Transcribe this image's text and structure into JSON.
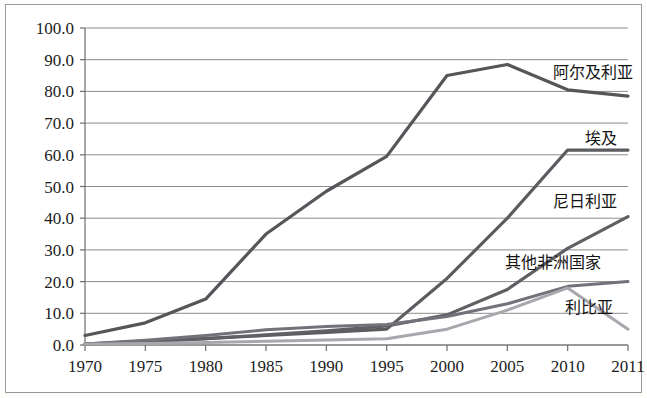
{
  "chart_data": {
    "type": "line",
    "title": "",
    "subtitle": "",
    "xlabel": "",
    "ylabel": "",
    "categories": [
      "1970",
      "1975",
      "1980",
      "1985",
      "1990",
      "1995",
      "2000",
      "2005",
      "2010",
      "2011"
    ],
    "ylim": [
      0,
      100
    ],
    "ytick_labels": [
      "0.0",
      "10.0",
      "20.0",
      "30.0",
      "40.0",
      "50.0",
      "60.0",
      "70.0",
      "80.0",
      "90.0",
      "100.0"
    ],
    "ytick_values": [
      0,
      10,
      20,
      30,
      40,
      50,
      60,
      70,
      80,
      90,
      100
    ],
    "grid": true,
    "grid_axis": "y",
    "legend": "inline-right-labels",
    "series": [
      {
        "name": "阿尔及利亚",
        "color": "#55555a",
        "width": 3.2,
        "label_x": 553,
        "label_y": 78,
        "values": [
          3.0,
          7.0,
          14.5,
          35.0,
          48.5,
          59.5,
          85.0,
          88.5,
          80.5,
          78.5
        ]
      },
      {
        "name": "埃及",
        "color": "#5b5b60",
        "width": 3.2,
        "label_x": 585,
        "label_y": 144,
        "values": [
          0.3,
          1.2,
          2.0,
          3.0,
          4.0,
          5.0,
          21.0,
          40.0,
          61.5,
          61.5
        ]
      },
      {
        "name": "尼日利亚",
        "color": "#5f5f64",
        "width": 3.2,
        "label_x": 553,
        "label_y": 207,
        "values": [
          0.2,
          1.0,
          2.0,
          3.2,
          4.5,
          6.0,
          9.5,
          17.5,
          30.5,
          40.5
        ]
      },
      {
        "name": "其他非洲国家",
        "color": "#72727a",
        "width": 3.0,
        "label_x": 505,
        "label_y": 268,
        "values": [
          0.3,
          1.5,
          3.0,
          4.8,
          5.8,
          6.5,
          9.0,
          13.0,
          18.5,
          20.0
        ]
      },
      {
        "name": "利比亚",
        "color": "#a7a7ad",
        "width": 3.0,
        "label_x": 565,
        "label_y": 313,
        "values": [
          0.2,
          0.5,
          0.8,
          1.2,
          1.6,
          2.0,
          5.0,
          11.0,
          18.0,
          5.0
        ]
      }
    ]
  },
  "plot_geometry": {
    "left": 85,
    "right": 628,
    "top": 28,
    "bottom": 345
  }
}
